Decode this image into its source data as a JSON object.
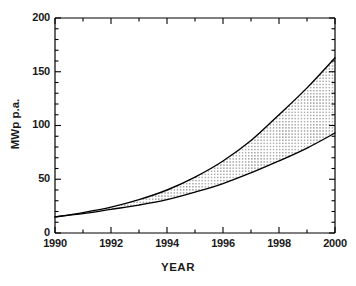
{
  "chart_data": {
    "type": "area",
    "title": "",
    "subtitle": "",
    "xlabel": "YEAR",
    "ylabel": "MWp p.a.",
    "xlim": [
      1990,
      2000
    ],
    "ylim": [
      0,
      200
    ],
    "grid": false,
    "legend": "none",
    "fill_style": "stippled-dots",
    "x": [
      1990,
      1991,
      1992,
      1993,
      1994,
      1995,
      1996,
      1997,
      1998,
      1999,
      2000
    ],
    "series": [
      {
        "name": "Upper scenario",
        "values": [
          15,
          19,
          24,
          31,
          40,
          52,
          67,
          86,
          110,
          135,
          163
        ]
      },
      {
        "name": "Lower scenario",
        "values": [
          15,
          18,
          22,
          26,
          31,
          38,
          46,
          56,
          67,
          79,
          93
        ]
      }
    ],
    "x_ticks": [
      1990,
      1992,
      1994,
      1996,
      1998,
      2000
    ],
    "x_tick_labels": [
      "1990",
      "1992",
      "1994",
      "1996",
      "1998",
      "2000"
    ],
    "x_minor_tick_interval": 1,
    "y_ticks": [
      0,
      50,
      100,
      150,
      200
    ],
    "y_tick_labels": [
      "0",
      "50",
      "100",
      "150",
      "200"
    ],
    "y_minor_tick_interval": 10,
    "annotations": []
  },
  "axes": {
    "y_tick_labels": [
      "200",
      "150",
      "100",
      "50",
      "0"
    ],
    "x_tick_labels": [
      "1990",
      "1992",
      "1994",
      "1996",
      "1998",
      "2000"
    ],
    "x_title": "YEAR",
    "y_title": "MWp p.a."
  },
  "colors": {
    "line": "#000000",
    "fill_dot": "#1a1a1a",
    "background": "#ffffff",
    "text": "#1a1a1a"
  }
}
